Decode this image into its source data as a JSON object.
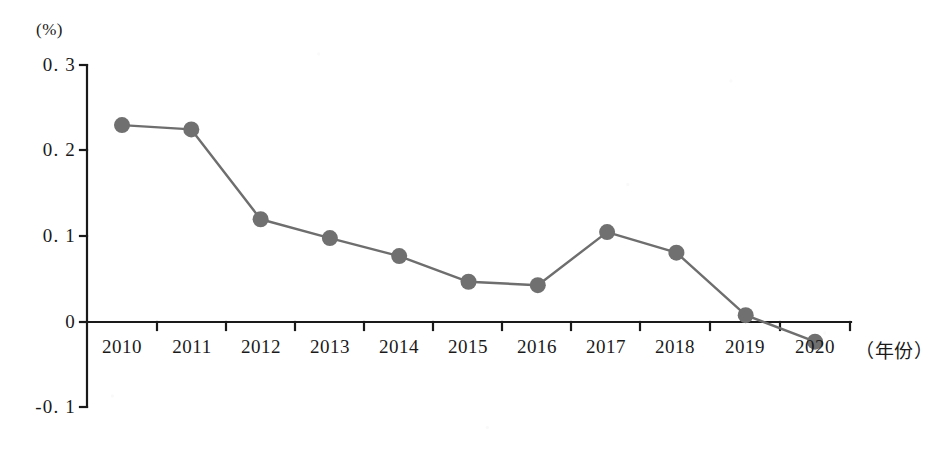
{
  "chart_data": {
    "type": "line",
    "title": "",
    "subtitle": "",
    "xlabel": "（年份）",
    "ylabel": "(%)",
    "unit_label": "(%)",
    "categories": [
      "2010",
      "2011",
      "2012",
      "2013",
      "2014",
      "2015",
      "2016",
      "2017",
      "2018",
      "2019",
      "2020"
    ],
    "values": [
      0.23,
      0.225,
      0.12,
      0.098,
      0.077,
      0.047,
      0.043,
      0.105,
      0.081,
      0.008,
      -0.023
    ],
    "series": [
      {
        "name": "",
        "values": [
          0.23,
          0.225,
          0.12,
          0.098,
          0.077,
          0.047,
          0.043,
          0.105,
          0.081,
          0.008,
          -0.023
        ]
      }
    ],
    "ylim": [
      -0.1,
      0.3
    ],
    "xlim": [
      "2010",
      "2020"
    ],
    "ytick_labels": [
      "0. 3",
      "0. 2",
      "0. 1",
      "0",
      "-0. 1"
    ],
    "ytick_values": [
      0.3,
      0.2,
      0.1,
      0,
      -0.1
    ],
    "xtick_labels": [
      "2010",
      "2011",
      "2012",
      "2013",
      "2014",
      "2015",
      "2016",
      "2017",
      "2018",
      "2019",
      "2020"
    ],
    "grid": false,
    "legend": "none",
    "marker": "circle",
    "colors": {
      "line": "#6e6e6e",
      "marker": "#707070",
      "axis": "#1a1a1a",
      "text": "#1a1a1a",
      "background": "#ffffff"
    }
  }
}
